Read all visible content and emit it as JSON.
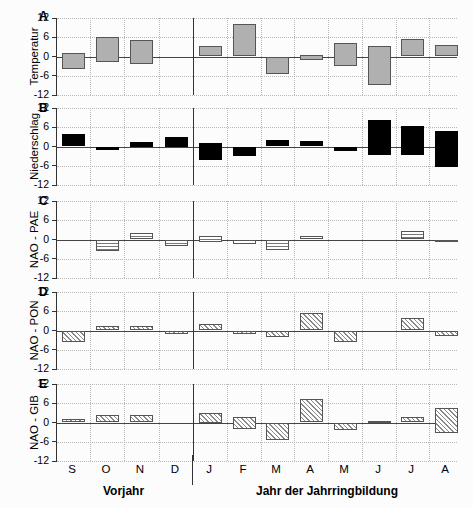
{
  "chart_data": {
    "type": "bar",
    "title": "",
    "subtitle": "",
    "xlabel": "",
    "ylabel": "",
    "ylim": [
      -12,
      12
    ],
    "yticks": [
      12,
      6,
      0,
      -6,
      -12
    ],
    "ytick_labels": [
      "12",
      "6",
      "0",
      "-6",
      "-12"
    ],
    "grid": true,
    "legend": false,
    "legend_position": "none",
    "categories": [
      "S",
      "O",
      "N",
      "D",
      "J",
      "F",
      "M",
      "A",
      "M",
      "J",
      "J",
      "A"
    ],
    "group_labels": [
      "Vorjahr",
      "Jahr der Jahrringbildung"
    ],
    "group_split_after_index": 3,
    "note": "Floating/range bars: each bar is drawn from low to high value on a -12..12 axis.",
    "panels": [
      {
        "id": "A",
        "panel_letter": "A",
        "ylabel": "Temperatur",
        "fill": "solid-grey",
        "bars": [
          {
            "category": "S",
            "low": -4.0,
            "high": 1.0
          },
          {
            "category": "O",
            "low": -1.7,
            "high": 6.0
          },
          {
            "category": "N",
            "low": -2.2,
            "high": 5.0
          },
          {
            "category": "D",
            "low": 0.0,
            "high": 0.0
          },
          {
            "category": "J",
            "low": 0.0,
            "high": 3.3
          },
          {
            "category": "F",
            "low": 0.0,
            "high": 10.2
          },
          {
            "category": "M",
            "low": -5.6,
            "high": 0.0
          },
          {
            "category": "A",
            "low": -1.2,
            "high": 0.6
          },
          {
            "category": "M",
            "low": -3.0,
            "high": 4.2
          },
          {
            "category": "J",
            "low": -8.8,
            "high": 3.3
          },
          {
            "category": "J",
            "low": 0.0,
            "high": 5.4
          },
          {
            "category": "A",
            "low": 0.0,
            "high": 3.6
          }
        ]
      },
      {
        "id": "B",
        "panel_letter": "B",
        "ylabel": "Niederschlag",
        "fill": "solid-black",
        "bars": [
          {
            "category": "S",
            "low": 0.0,
            "high": 4.0
          },
          {
            "category": "O",
            "low": -1.1,
            "high": 0.0
          },
          {
            "category": "N",
            "low": 0.0,
            "high": 1.5
          },
          {
            "category": "D",
            "low": 0.0,
            "high": 3.0
          },
          {
            "category": "J",
            "low": -4.2,
            "high": 1.1
          },
          {
            "category": "F",
            "low": -3.1,
            "high": 0.0
          },
          {
            "category": "M",
            "low": 0.0,
            "high": 1.9
          },
          {
            "category": "A",
            "low": 0.0,
            "high": 1.6
          },
          {
            "category": "M",
            "low": -1.3,
            "high": 0.0
          },
          {
            "category": "J",
            "low": -2.5,
            "high": 8.2
          },
          {
            "category": "J",
            "low": -2.8,
            "high": 6.3
          },
          {
            "category": "A",
            "low": -6.3,
            "high": 4.9
          }
        ]
      },
      {
        "id": "C",
        "panel_letter": "C",
        "ylabel": "NAO - PAE",
        "fill": "horizontal-hatch",
        "bars": [
          {
            "category": "S",
            "low": 0.0,
            "high": 0.0
          },
          {
            "category": "O",
            "low": -3.6,
            "high": 0.0
          },
          {
            "category": "N",
            "low": 0.0,
            "high": 2.0
          },
          {
            "category": "D",
            "low": -1.9,
            "high": 0.0
          },
          {
            "category": "J",
            "low": -0.9,
            "high": 1.0
          },
          {
            "category": "F",
            "low": -1.5,
            "high": 0.0
          },
          {
            "category": "M",
            "low": -3.4,
            "high": 0.0
          },
          {
            "category": "A",
            "low": 0.0,
            "high": 1.1
          },
          {
            "category": "M",
            "low": 0.0,
            "high": 0.0
          },
          {
            "category": "J",
            "low": 0.0,
            "high": 0.0
          },
          {
            "category": "J",
            "low": 0.0,
            "high": 2.6
          },
          {
            "category": "A",
            "low": -0.9,
            "high": 0.0
          }
        ]
      },
      {
        "id": "D",
        "panel_letter": "D",
        "ylabel": "NAO - PON",
        "fill": "diagonal-hatch",
        "bars": [
          {
            "category": "S",
            "low": -3.5,
            "high": 0.0
          },
          {
            "category": "O",
            "low": 0.0,
            "high": 1.3
          },
          {
            "category": "N",
            "low": 0.0,
            "high": 1.3
          },
          {
            "category": "D",
            "low": -1.2,
            "high": 0.0
          },
          {
            "category": "J",
            "low": 0.0,
            "high": 2.0
          },
          {
            "category": "F",
            "low": -1.2,
            "high": 0.0
          },
          {
            "category": "M",
            "low": -2.0,
            "high": 0.0
          },
          {
            "category": "A",
            "low": 0.0,
            "high": 5.4
          },
          {
            "category": "M",
            "low": -3.5,
            "high": 0.0
          },
          {
            "category": "J",
            "low": 0.0,
            "high": 0.0
          },
          {
            "category": "J",
            "low": 0.0,
            "high": 4.0
          },
          {
            "category": "A",
            "low": -1.8,
            "high": 0.0
          }
        ]
      },
      {
        "id": "E",
        "panel_letter": "E",
        "ylabel": "NAO - GIB",
        "fill": "diagonal-hatch",
        "bars": [
          {
            "category": "S",
            "low": 0.0,
            "high": 1.1
          },
          {
            "category": "O",
            "low": 0.0,
            "high": 2.2
          },
          {
            "category": "N",
            "low": 0.0,
            "high": 2.2
          },
          {
            "category": "D",
            "low": 0.0,
            "high": 0.0
          },
          {
            "category": "J",
            "low": 0.0,
            "high": 3.0
          },
          {
            "category": "F",
            "low": -2.0,
            "high": 1.6
          },
          {
            "category": "M",
            "low": -5.3,
            "high": 0.0
          },
          {
            "category": "A",
            "low": 0.0,
            "high": 7.4
          },
          {
            "category": "M",
            "low": -2.4,
            "high": 0.0
          },
          {
            "category": "J",
            "low": 0.0,
            "high": 0.6
          },
          {
            "category": "J",
            "low": 0.0,
            "high": 1.7
          },
          {
            "category": "A",
            "low": -3.4,
            "high": 4.4
          }
        ]
      }
    ]
  }
}
